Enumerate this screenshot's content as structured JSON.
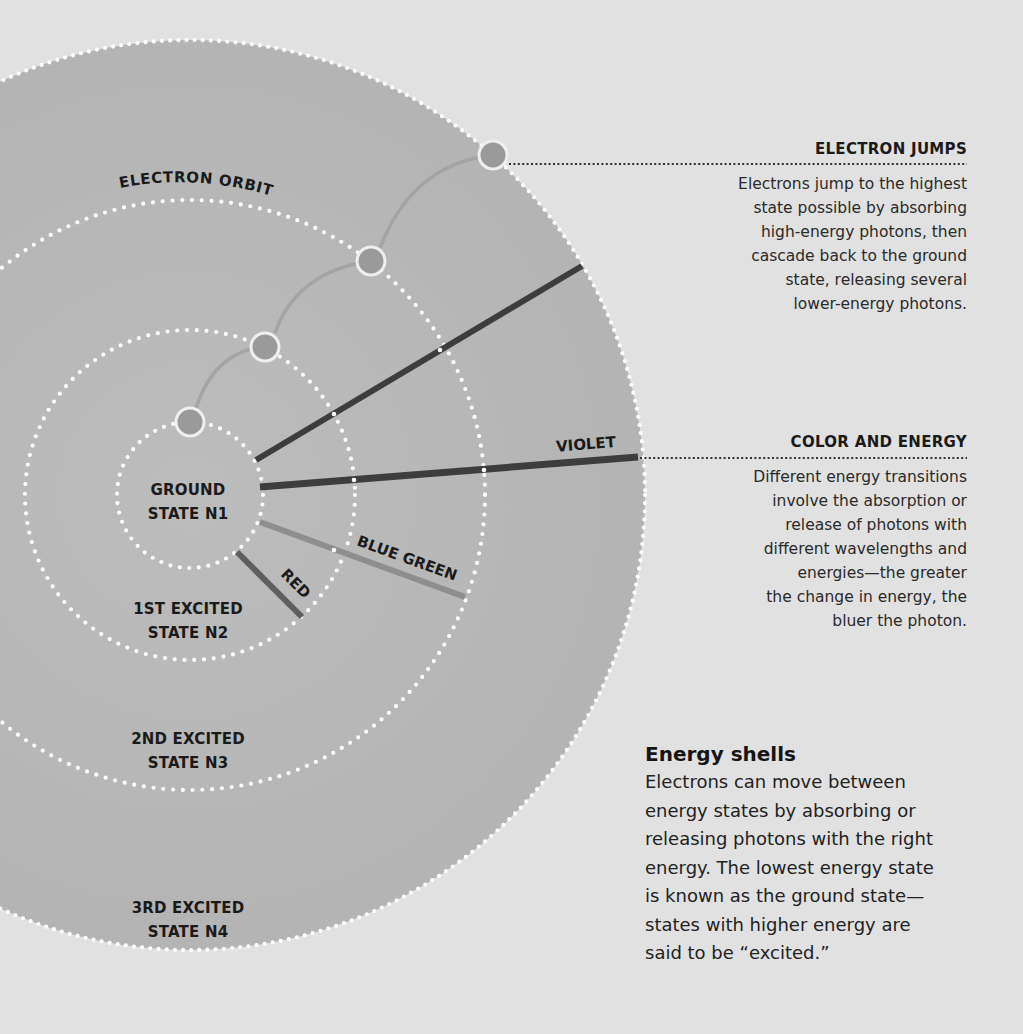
{
  "diagram": {
    "title": "Energy shells",
    "center": {
      "x": 190,
      "y": 495
    },
    "colors": {
      "background": "#e1e1e1",
      "atom_fill": "#b9b9b9",
      "orbit_dots": "#ffffff",
      "electron_fill": "#9a9a9a",
      "electron_ring": "#efefef",
      "jump_arc": "#a4a4a4",
      "violet_line": "#3d3d3d",
      "blue_green_line": "#8e8e8e",
      "red_line": "#5e5e5e",
      "leader_line": "#333333"
    },
    "orbits": [
      {
        "name": "n1",
        "radius": 73
      },
      {
        "name": "n2",
        "radius": 165
      },
      {
        "name": "n3",
        "radius": 295
      },
      {
        "name": "n4",
        "radius": 455
      }
    ],
    "electrons": [
      {
        "x": 190,
        "y": 422
      },
      {
        "x": 265,
        "y": 347
      },
      {
        "x": 371,
        "y": 261
      },
      {
        "x": 493,
        "y": 155
      }
    ],
    "transitions": [
      {
        "label": "",
        "x1": 256,
        "y1": 460,
        "x2": 582,
        "y2": 266,
        "color": "#3d3d3d"
      },
      {
        "label": "VIOLET",
        "x1": 260,
        "y1": 487,
        "x2": 638,
        "y2": 457,
        "color": "#3d3d3d"
      },
      {
        "label": "BLUE GREEN",
        "x1": 260,
        "y1": 522,
        "x2": 465,
        "y2": 597,
        "color": "#8e8e8e"
      },
      {
        "label": "RED",
        "x1": 237,
        "y1": 552,
        "x2": 302,
        "y2": 617,
        "color": "#5e5e5e"
      }
    ],
    "labels": {
      "electron_orbit": "ELECTRON ORBIT",
      "violet": "VIOLET",
      "blue_green": "BLUE GREEN",
      "red": "RED"
    },
    "states": [
      {
        "line1": "GROUND",
        "line2": "STATE N1"
      },
      {
        "line1": "1ST EXCITED",
        "line2": "STATE N2"
      },
      {
        "line1": "2ND EXCITED",
        "line2": "STATE N3"
      },
      {
        "line1": "3RD EXCITED",
        "line2": "STATE N4"
      }
    ]
  },
  "callouts": {
    "electron_jumps": {
      "title": "ELECTRON JUMPS",
      "lines": [
        "Electrons jump to the highest",
        "state possible by absorbing",
        "high-energy photons, then",
        "cascade back to the ground",
        "state, releasing several",
        "lower-energy photons."
      ]
    },
    "color_and_energy": {
      "title": "COLOR AND ENERGY",
      "lines": [
        "Different energy transitions",
        "involve the absorption or",
        "release of photons with",
        "different wavelengths and",
        "energies—the greater",
        "the change in energy, the",
        "bluer the photon."
      ]
    }
  },
  "energy_shells": {
    "title": "Energy shells",
    "lines": [
      "Electrons can move between",
      "energy states by absorbing or",
      "releasing photons with the right",
      "energy. The lowest energy state",
      "is known as the ground state—",
      "states with higher energy are",
      "said to be “excited.”"
    ]
  }
}
